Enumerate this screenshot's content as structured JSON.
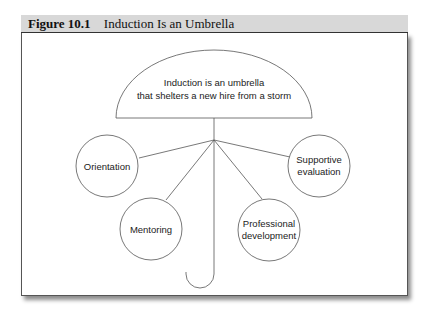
{
  "figure": {
    "number": "Figure 10.1",
    "title": "Induction Is an Umbrella"
  },
  "umbrella": {
    "canopy_text_line1": "Induction is an umbrella",
    "canopy_text_line2": "that shelters a new hire from a storm"
  },
  "nodes": [
    {
      "id": "orientation",
      "line1": "Orientation",
      "line2": ""
    },
    {
      "id": "mentoring",
      "line1": "Mentoring",
      "line2": ""
    },
    {
      "id": "professional-development",
      "line1": "Professional",
      "line2": "development"
    },
    {
      "id": "supportive-evaluation",
      "line1": "Supportive",
      "line2": "evaluation"
    }
  ],
  "colors": {
    "header_bg": "#d8d8d8",
    "stroke": "#555555",
    "text": "#222222"
  }
}
